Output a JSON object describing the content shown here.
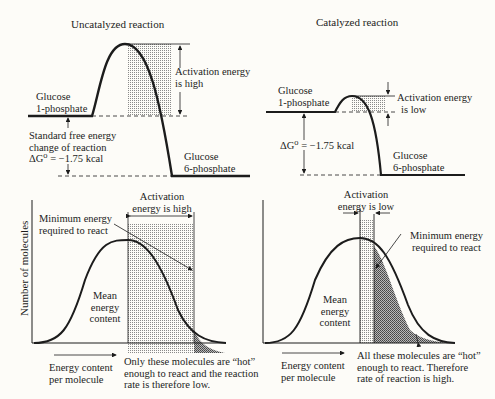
{
  "panels": {
    "uncatalyzed_energy": {
      "title": "Uncatalyzed reaction",
      "reactant": [
        "Glucose",
        "1-phosphate"
      ],
      "product": [
        "Glucose",
        "6-phosphate"
      ],
      "activation": [
        "Activation energy",
        "is high"
      ],
      "free_energy": [
        "Standard free energy",
        "change of reaction",
        "ΔG⁰ = −1.75 kcal"
      ]
    },
    "catalyzed_energy": {
      "title": "Catalyzed reaction",
      "reactant": [
        "Glucose",
        "1-phosphate"
      ],
      "product": [
        "Glucose",
        "6-phosphate"
      ],
      "activation": [
        "Activation energy",
        "is low"
      ],
      "free_energy": "ΔG⁰ = −1.75 kcal"
    },
    "uncatalyzed_distribution": {
      "ylabel": "Number of molecules",
      "activation": [
        "Activation",
        "energy is high"
      ],
      "minimum": [
        "Minimum energy",
        "required to react"
      ],
      "mean": [
        "Mean",
        "energy",
        "content"
      ],
      "xlabel": [
        "Energy content",
        "per molecule"
      ],
      "note": [
        "Only these molecules are “hot”",
        "enough to react and the reaction",
        "rate is therefore low."
      ]
    },
    "catalyzed_distribution": {
      "activation": [
        "Activation",
        "energy is low"
      ],
      "minimum": [
        "Minimum energy",
        "required to react"
      ],
      "mean": [
        "Mean",
        "energy",
        "content"
      ],
      "xlabel": [
        "Energy content",
        "per molecule"
      ],
      "note": [
        "All these molecules are “hot”",
        "enough to react.  Therefore",
        "rate of reaction is high."
      ]
    }
  },
  "colors": {
    "line": "#1c1c1c",
    "background": "#fdfcf8",
    "stipple": "#9a9a9a"
  }
}
